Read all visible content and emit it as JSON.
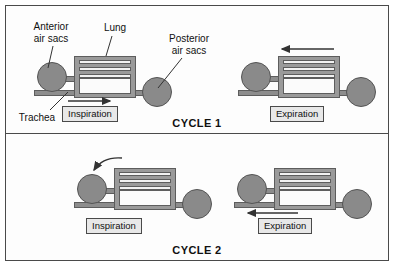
{
  "figure": {
    "title_cycle1": "CYCLE 1",
    "title_cycle2": "CYCLE 2"
  },
  "labels": {
    "anterior_air_sacs": "Anterior\nair sacs",
    "anterior_line1": "Anterior",
    "anterior_line2": "air sacs",
    "lung": "Lung",
    "posterior_line1": "Posterior",
    "posterior_line2": "air sacs",
    "trachea": "Trachea"
  },
  "panels": [
    {
      "cycle": "CYCLE 1",
      "steps": [
        {
          "phase": "Inspiration",
          "airflow_direction": "right",
          "arrow_position": "along-trachea",
          "description": "Air flows in through trachea into posterior air sacs"
        },
        {
          "phase": "Expiration",
          "airflow_direction": "left",
          "arrow_position": "above-lung",
          "description": "Air moves from posterior air sacs through lung"
        }
      ]
    },
    {
      "cycle": "CYCLE 2",
      "steps": [
        {
          "phase": "Inspiration",
          "airflow_direction": "down-left",
          "arrow_position": "curved-into-anterior-sac",
          "description": "Air moves from lung into anterior air sacs"
        },
        {
          "phase": "Expiration",
          "airflow_direction": "left",
          "arrow_position": "along-trachea",
          "description": "Air exits from anterior air sacs out the trachea"
        }
      ]
    }
  ],
  "anatomy": {
    "parabronchi_count": 3,
    "structures": [
      "trachea",
      "anterior air sacs",
      "lung",
      "posterior air sacs"
    ]
  },
  "colors": {
    "background": "#fdfdfd",
    "frame": "#4a4a4a",
    "tissue_fill": "#8d8d8d",
    "tissue_stroke": "#5d5d5d",
    "sac_fill": "#8a8a8a",
    "lung_fill": "#9a9a9a",
    "phase_box_fill": "#e8e8e8",
    "text": "#111111"
  }
}
